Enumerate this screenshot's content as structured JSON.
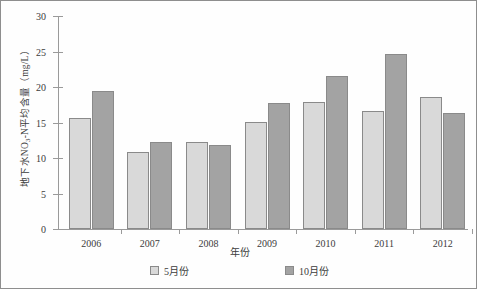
{
  "chart_data": {
    "type": "bar",
    "title": "",
    "subtitle": "",
    "xlabel": "年份",
    "ylabel": "地下水NO₃-N平均含量（mg/L）",
    "ylabel_parts": {
      "prefix": "地下水NO",
      "subscript": "3",
      "suffix": "-N平均含量（mg/L）"
    },
    "categories": [
      "2006",
      "2007",
      "2008",
      "2009",
      "2010",
      "2011",
      "2012"
    ],
    "series": [
      {
        "name": "5月份",
        "color": "#d9d9d9",
        "values": [
          15.7,
          10.9,
          12.2,
          15.1,
          17.9,
          16.6,
          18.6
        ]
      },
      {
        "name": "10月份",
        "color": "#a3a3a3",
        "values": [
          19.4,
          12.3,
          11.8,
          17.8,
          21.6,
          24.7,
          16.4
        ]
      }
    ],
    "ylim": [
      0,
      30
    ],
    "ytick_values": [
      0,
      5,
      10,
      15,
      20,
      25,
      30
    ],
    "ytick_labels": [
      "0",
      "5",
      "10",
      "15",
      "20",
      "25",
      "30"
    ],
    "grid": false,
    "legend_position": "bottom",
    "border_color": "#8a8a8a",
    "axis_color": "#9a9a9a",
    "text_color": "#3c3c3c"
  }
}
